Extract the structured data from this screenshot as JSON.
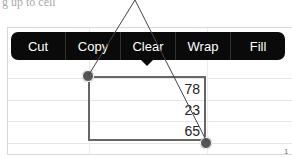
{
  "top_text": "g up to cell",
  "context_menu": {
    "items": [
      {
        "label": "Cut"
      },
      {
        "label": "Copy"
      },
      {
        "label": "Clear"
      },
      {
        "label": "Wrap"
      },
      {
        "label": "Fill"
      }
    ]
  },
  "selection": {
    "values": [
      "78",
      "23",
      "65"
    ]
  },
  "corner_text": "1"
}
